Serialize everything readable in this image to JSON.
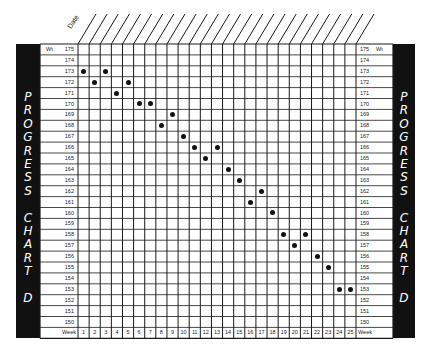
{
  "sidebar": {
    "word1": [
      "P",
      "R",
      "O",
      "G",
      "R",
      "E",
      "S",
      "S"
    ],
    "word2": [
      "C",
      "H",
      "A",
      "R",
      "T"
    ],
    "word3": [
      "D"
    ]
  },
  "header": {
    "date_label": "Date"
  },
  "labels": {
    "weight": "Wt",
    "week": "Week"
  },
  "weights": [
    175,
    174,
    173,
    172,
    171,
    170,
    169,
    168,
    167,
    166,
    165,
    164,
    163,
    162,
    161,
    160,
    159,
    158,
    157,
    156,
    155,
    154,
    153,
    152,
    151,
    150
  ],
  "weeks": [
    1,
    2,
    3,
    4,
    5,
    6,
    7,
    8,
    9,
    10,
    11,
    12,
    13,
    14,
    15,
    16,
    17,
    18,
    19,
    20,
    21,
    22,
    23,
    24,
    25
  ],
  "chart_data": {
    "type": "scatter",
    "xlabel": "Week",
    "ylabel": "Wt",
    "x": [
      1,
      2,
      3,
      4,
      5,
      6,
      7,
      8,
      9,
      10,
      11,
      12,
      13,
      14,
      15,
      16,
      17,
      18,
      19,
      20,
      21,
      22,
      23,
      24,
      25
    ],
    "y": [
      173,
      172,
      173,
      171,
      172,
      170,
      170,
      168,
      169,
      167,
      166,
      165,
      166,
      164,
      163,
      161,
      162,
      160,
      158,
      157,
      158,
      156,
      155,
      153,
      153
    ],
    "xlim": [
      1,
      25
    ],
    "ylim": [
      150,
      175
    ],
    "grid": true,
    "legend": null
  }
}
